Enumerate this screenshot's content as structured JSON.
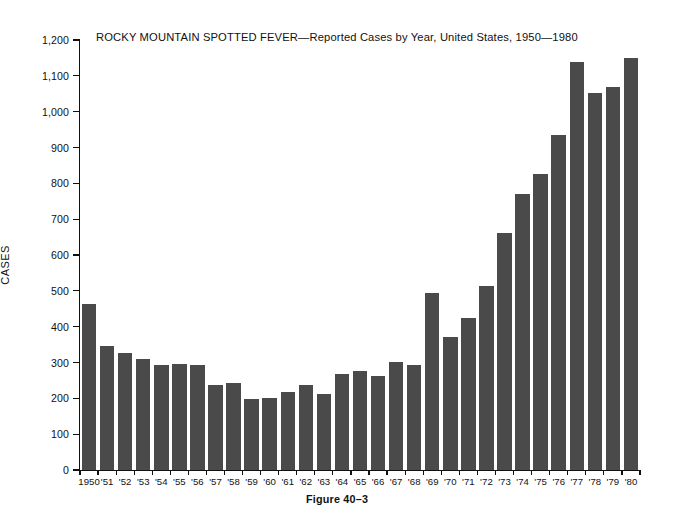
{
  "figure": {
    "caption": "Figure 40–3",
    "y_axis_label": "CASES"
  },
  "chart_data": {
    "type": "bar",
    "title": "ROCKY  MOUNTAIN  SPOTTED  FEVER—Reported Cases by Year, United States, 1950—1980",
    "xlabel": "",
    "ylabel": "CASES",
    "ylim": [
      0,
      1200
    ],
    "ytick_step": 100,
    "ytick_labels": [
      "0",
      "100",
      "200",
      "300",
      "400",
      "500",
      "600",
      "700",
      "800",
      "900",
      "1,000",
      "1,100",
      "1,200"
    ],
    "grid": false,
    "legend": null,
    "bar_color": "#4a4a4a",
    "categories": [
      "1950",
      "'51",
      "'52",
      "'53",
      "'54",
      "'55",
      "'56",
      "'57",
      "'58",
      "'59",
      "'60",
      "'61",
      "'62",
      "'63",
      "'64",
      "'65",
      "'66",
      "'67",
      "'68",
      "'69",
      "'70",
      "'71",
      "'72",
      "'73",
      "'74",
      "'75",
      "'76",
      "'77",
      "'78",
      "'79",
      "'80"
    ],
    "years": [
      1950,
      1951,
      1952,
      1953,
      1954,
      1955,
      1956,
      1957,
      1958,
      1959,
      1960,
      1961,
      1962,
      1963,
      1964,
      1965,
      1966,
      1967,
      1968,
      1969,
      1970,
      1971,
      1972,
      1973,
      1974,
      1975,
      1976,
      1977,
      1978,
      1979,
      1980
    ],
    "values": [
      464,
      345,
      326,
      311,
      293,
      295,
      292,
      237,
      244,
      199,
      200,
      219,
      236,
      213,
      268,
      277,
      261,
      302,
      293,
      494,
      372,
      425,
      514,
      661,
      769,
      826,
      935,
      1139,
      1052,
      1068,
      1151
    ]
  }
}
